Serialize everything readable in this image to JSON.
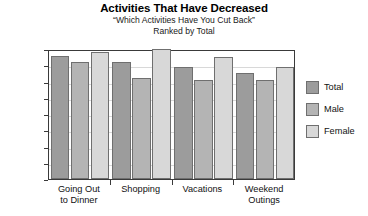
{
  "chart_data": {
    "type": "bar",
    "title": "Activities That Have Decreased",
    "subtitle": "“Which Activities Have You Cut Back”",
    "subtitle2": "Ranked by Total",
    "xlabel": "",
    "ylabel": "",
    "ylim": [
      0,
      40
    ],
    "ytick_labels": [
      "40%",
      "35%",
      "30%",
      "25%",
      "20%",
      "15%",
      "10%",
      "5%",
      "0%"
    ],
    "ytick_values": [
      40,
      35,
      30,
      25,
      20,
      15,
      10,
      5,
      0
    ],
    "grid": true,
    "legend_position": "right",
    "categories": [
      "Going Out to Dinner",
      "Shopping",
      "Vacations",
      "Weekend Outings"
    ],
    "category_lines": [
      [
        "Going Out",
        "to Dinner"
      ],
      [
        "Shopping",
        ""
      ],
      [
        "Vacations",
        ""
      ],
      [
        "Weekend",
        "Outings"
      ]
    ],
    "series": [
      {
        "name": "Total",
        "color": "#9c9c9c",
        "values": [
          38.0,
          36.0,
          34.5,
          32.5
        ]
      },
      {
        "name": "Male",
        "color": "#b4b4b4",
        "values": [
          36.0,
          31.0,
          30.5,
          30.5
        ]
      },
      {
        "name": "Female",
        "color": "#d8d8d8",
        "values": [
          39.0,
          40.0,
          37.5,
          34.5
        ]
      }
    ]
  },
  "legend": {
    "items": [
      {
        "label": "Total"
      },
      {
        "label": "Male"
      },
      {
        "label": "Female"
      }
    ]
  }
}
